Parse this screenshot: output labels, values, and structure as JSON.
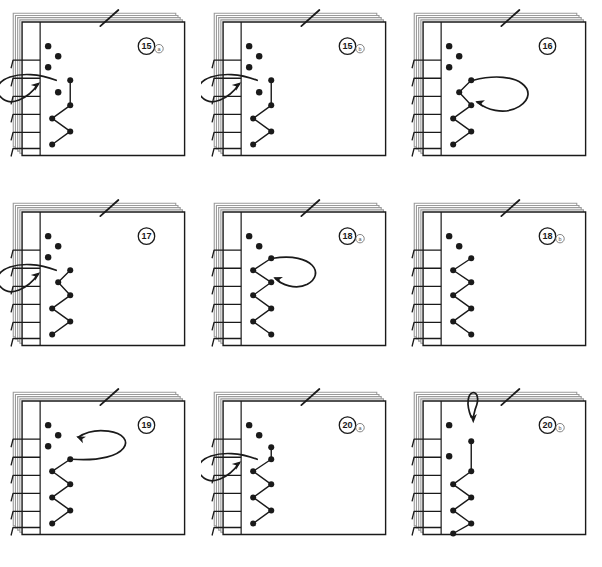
{
  "figure": {
    "type": "instructional-diagram",
    "rows": 3,
    "columns": 3,
    "background_color": "#ffffff",
    "ink_color": "#1a1a1a",
    "page_fill": "#ffffff",
    "stack_edge_color": "#9a9a9a"
  },
  "panels": [
    {
      "id": "panel-15a",
      "step_number": "15",
      "step_suffix": "a",
      "arrow": {
        "kind": "loop-left",
        "direction": "right",
        "description": "thread loops around the spine from the left and re-enters at hole 4"
      },
      "holes": [
        {
          "index": 1,
          "x": 26,
          "y": 24,
          "sewn": false
        },
        {
          "index": 2,
          "x": 36,
          "y": 34,
          "sewn": false
        },
        {
          "index": 3,
          "x": 26,
          "y": 45,
          "sewn": false
        },
        {
          "index": 4,
          "x": 48,
          "y": 58,
          "sewn": true
        },
        {
          "index": 5,
          "x": 36,
          "y": 70,
          "sewn": false
        },
        {
          "index": 6,
          "x": 48,
          "y": 83,
          "sewn": true
        },
        {
          "index": 7,
          "x": 30,
          "y": 96,
          "sewn": true
        },
        {
          "index": 8,
          "x": 48,
          "y": 109,
          "sewn": true
        },
        {
          "index": 9,
          "x": 30,
          "y": 122,
          "sewn": true
        }
      ]
    },
    {
      "id": "panel-15b",
      "step_number": "15",
      "step_suffix": "b",
      "arrow": {
        "kind": "loop-left",
        "direction": "right",
        "description": "thread wraps the spine edge and pulls tight into hole 4"
      },
      "holes": [
        {
          "index": 1,
          "x": 26,
          "y": 24,
          "sewn": false
        },
        {
          "index": 2,
          "x": 36,
          "y": 34,
          "sewn": false
        },
        {
          "index": 3,
          "x": 26,
          "y": 45,
          "sewn": false
        },
        {
          "index": 4,
          "x": 48,
          "y": 58,
          "sewn": true
        },
        {
          "index": 5,
          "x": 36,
          "y": 70,
          "sewn": false
        },
        {
          "index": 6,
          "x": 48,
          "y": 83,
          "sewn": true
        },
        {
          "index": 7,
          "x": 30,
          "y": 96,
          "sewn": true
        },
        {
          "index": 8,
          "x": 48,
          "y": 109,
          "sewn": true
        },
        {
          "index": 9,
          "x": 30,
          "y": 122,
          "sewn": true
        }
      ]
    },
    {
      "id": "panel-16",
      "step_number": "16",
      "step_suffix": "",
      "arrow": {
        "kind": "loop-right",
        "direction": "left",
        "description": "thread loops over the page face back toward the spine"
      },
      "holes": [
        {
          "index": 1,
          "x": 26,
          "y": 24,
          "sewn": false
        },
        {
          "index": 2,
          "x": 36,
          "y": 34,
          "sewn": false
        },
        {
          "index": 3,
          "x": 26,
          "y": 45,
          "sewn": false
        },
        {
          "index": 4,
          "x": 48,
          "y": 58,
          "sewn": true
        },
        {
          "index": 5,
          "x": 36,
          "y": 70,
          "sewn": true
        },
        {
          "index": 6,
          "x": 48,
          "y": 83,
          "sewn": true
        },
        {
          "index": 7,
          "x": 30,
          "y": 96,
          "sewn": true
        },
        {
          "index": 8,
          "x": 48,
          "y": 109,
          "sewn": true
        },
        {
          "index": 9,
          "x": 30,
          "y": 122,
          "sewn": true
        }
      ]
    },
    {
      "id": "panel-17",
      "step_number": "17",
      "step_suffix": "",
      "arrow": {
        "kind": "loop-left",
        "direction": "right",
        "description": "thread comes around the spine and re-enters the top sewn hole"
      },
      "holes": [
        {
          "index": 1,
          "x": 26,
          "y": 24,
          "sewn": false
        },
        {
          "index": 2,
          "x": 36,
          "y": 34,
          "sewn": false
        },
        {
          "index": 3,
          "x": 26,
          "y": 45,
          "sewn": false
        },
        {
          "index": 4,
          "x": 48,
          "y": 58,
          "sewn": true
        },
        {
          "index": 5,
          "x": 36,
          "y": 70,
          "sewn": true
        },
        {
          "index": 6,
          "x": 48,
          "y": 83,
          "sewn": true
        },
        {
          "index": 7,
          "x": 30,
          "y": 96,
          "sewn": true
        },
        {
          "index": 8,
          "x": 48,
          "y": 109,
          "sewn": true
        },
        {
          "index": 9,
          "x": 30,
          "y": 122,
          "sewn": true
        }
      ]
    },
    {
      "id": "panel-18a",
      "step_number": "18",
      "step_suffix": "a",
      "arrow": {
        "kind": "loop-right-small",
        "direction": "left",
        "description": "small loop over the face returning to the top sewn hole"
      },
      "holes": [
        {
          "index": 1,
          "x": 26,
          "y": 24,
          "sewn": false
        },
        {
          "index": 2,
          "x": 36,
          "y": 34,
          "sewn": false
        },
        {
          "index": 3,
          "x": 48,
          "y": 46,
          "sewn": true
        },
        {
          "index": 4,
          "x": 30,
          "y": 58,
          "sewn": true
        },
        {
          "index": 5,
          "x": 48,
          "y": 70,
          "sewn": true
        },
        {
          "index": 6,
          "x": 30,
          "y": 83,
          "sewn": true
        },
        {
          "index": 7,
          "x": 48,
          "y": 96,
          "sewn": true
        },
        {
          "index": 8,
          "x": 30,
          "y": 109,
          "sewn": true
        },
        {
          "index": 9,
          "x": 48,
          "y": 122,
          "sewn": true
        }
      ]
    },
    {
      "id": "panel-18b",
      "step_number": "18",
      "step_suffix": "b",
      "arrow": {
        "kind": "none",
        "direction": "",
        "description": "completed zigzag along the spine, no arrow shown"
      },
      "holes": [
        {
          "index": 1,
          "x": 26,
          "y": 24,
          "sewn": false
        },
        {
          "index": 2,
          "x": 36,
          "y": 34,
          "sewn": false
        },
        {
          "index": 3,
          "x": 48,
          "y": 46,
          "sewn": true
        },
        {
          "index": 4,
          "x": 30,
          "y": 58,
          "sewn": true
        },
        {
          "index": 5,
          "x": 48,
          "y": 70,
          "sewn": true
        },
        {
          "index": 6,
          "x": 30,
          "y": 83,
          "sewn": true
        },
        {
          "index": 7,
          "x": 48,
          "y": 96,
          "sewn": true
        },
        {
          "index": 8,
          "x": 30,
          "y": 109,
          "sewn": true
        },
        {
          "index": 9,
          "x": 48,
          "y": 122,
          "sewn": true
        }
      ]
    },
    {
      "id": "panel-19",
      "step_number": "19",
      "step_suffix": "",
      "arrow": {
        "kind": "loop-wide",
        "direction": "left",
        "description": "wide loop across the page face pointing back to the spine"
      },
      "holes": [
        {
          "index": 1,
          "x": 26,
          "y": 24,
          "sewn": false
        },
        {
          "index": 2,
          "x": 36,
          "y": 34,
          "sewn": false
        },
        {
          "index": 3,
          "x": 26,
          "y": 45,
          "sewn": false
        },
        {
          "index": 4,
          "x": 48,
          "y": 58,
          "sewn": true
        },
        {
          "index": 5,
          "x": 30,
          "y": 70,
          "sewn": true
        },
        {
          "index": 6,
          "x": 48,
          "y": 83,
          "sewn": true
        },
        {
          "index": 7,
          "x": 30,
          "y": 96,
          "sewn": true
        },
        {
          "index": 8,
          "x": 48,
          "y": 109,
          "sewn": true
        },
        {
          "index": 9,
          "x": 30,
          "y": 122,
          "sewn": true
        }
      ]
    },
    {
      "id": "panel-20a",
      "step_number": "20",
      "step_suffix": "a",
      "arrow": {
        "kind": "loop-left",
        "direction": "right",
        "description": "thread returns around the spine into the upper hole"
      },
      "holes": [
        {
          "index": 1,
          "x": 26,
          "y": 24,
          "sewn": false
        },
        {
          "index": 2,
          "x": 36,
          "y": 34,
          "sewn": false
        },
        {
          "index": 3,
          "x": 48,
          "y": 46,
          "sewn": true
        },
        {
          "index": 4,
          "x": 48,
          "y": 58,
          "sewn": true
        },
        {
          "index": 5,
          "x": 30,
          "y": 70,
          "sewn": true
        },
        {
          "index": 6,
          "x": 48,
          "y": 83,
          "sewn": true
        },
        {
          "index": 7,
          "x": 30,
          "y": 96,
          "sewn": true
        },
        {
          "index": 8,
          "x": 48,
          "y": 109,
          "sewn": true
        },
        {
          "index": 9,
          "x": 30,
          "y": 122,
          "sewn": true
        }
      ]
    },
    {
      "id": "panel-20b",
      "step_number": "20",
      "step_suffix": "b",
      "arrow": {
        "kind": "loop-top",
        "direction": "down",
        "description": "small loop at the head of the spine pointing downward"
      },
      "holes": [
        {
          "index": 1,
          "x": 26,
          "y": 24,
          "sewn": false
        },
        {
          "index": 2,
          "x": 48,
          "y": 40,
          "sewn": true
        },
        {
          "index": 3,
          "x": 26,
          "y": 55,
          "sewn": false
        },
        {
          "index": 4,
          "x": 48,
          "y": 70,
          "sewn": true
        },
        {
          "index": 5,
          "x": 30,
          "y": 83,
          "sewn": true
        },
        {
          "index": 6,
          "x": 48,
          "y": 96,
          "sewn": true
        },
        {
          "index": 7,
          "x": 30,
          "y": 109,
          "sewn": true
        },
        {
          "index": 8,
          "x": 48,
          "y": 122,
          "sewn": true
        },
        {
          "index": 9,
          "x": 30,
          "y": 132,
          "sewn": true
        }
      ]
    }
  ]
}
